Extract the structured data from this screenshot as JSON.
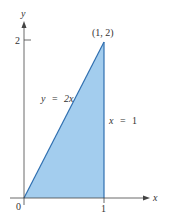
{
  "diagram": {
    "axes": {
      "x_label": "x",
      "y_label": "y",
      "origin_label": "0",
      "x_tick_label": "1",
      "y_tick_label": "2"
    },
    "region": {
      "vertices": [
        "(0, 0)",
        "(1, 2)",
        "(1, 0)"
      ],
      "fill_color": "#a3cdee",
      "edge_color": "#2f6fb0"
    },
    "labels": {
      "point": "(1, 2)",
      "line_lhs": "y",
      "line_eq": "=",
      "line_rhs": "2x",
      "vline_lhs": "x",
      "vline_eq": "=",
      "vline_rhs": "1"
    },
    "colors": {
      "axis": "#444444",
      "text": "#333333"
    }
  }
}
